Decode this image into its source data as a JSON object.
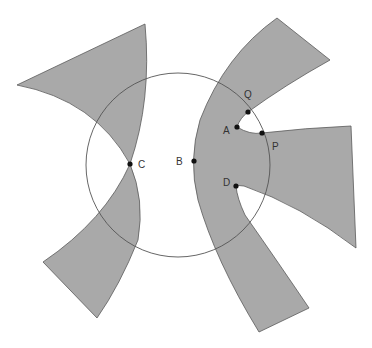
{
  "diagram": {
    "colors": {
      "region_fill": "#a9a9a9",
      "region_stroke": "#5a5a5a",
      "circle_stroke": "#555555",
      "point_fill": "#111111",
      "label_color": "#333333"
    },
    "circle": {
      "cx": 178,
      "cy": 165,
      "r": 92
    },
    "points": [
      {
        "id": "Q",
        "label": "Q",
        "x": 248,
        "y": 112,
        "lx": 244,
        "ly": 98
      },
      {
        "id": "A",
        "label": "A",
        "x": 237,
        "y": 127,
        "lx": 223,
        "ly": 134
      },
      {
        "id": "P",
        "label": "P",
        "x": 262,
        "y": 133,
        "lx": 272,
        "ly": 150
      },
      {
        "id": "B",
        "label": "B",
        "x": 194,
        "y": 161,
        "lx": 176,
        "ly": 165
      },
      {
        "id": "C",
        "label": "C",
        "x": 130,
        "y": 164,
        "lx": 138,
        "ly": 168
      },
      {
        "id": "D",
        "label": "D",
        "x": 236,
        "y": 186,
        "lx": 223,
        "ly": 186
      }
    ],
    "regions": [
      {
        "id": "upper-left-region",
        "label": ""
      },
      {
        "id": "lower-left-region",
        "label": ""
      },
      {
        "id": "right-region",
        "label": ""
      }
    ]
  }
}
